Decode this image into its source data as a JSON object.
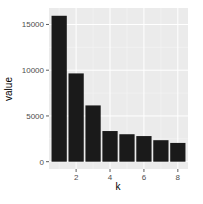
{
  "chart_data": {
    "type": "bar",
    "title": "",
    "xlabel": "k",
    "ylabel": "value",
    "categories": [
      1,
      2,
      3,
      4,
      5,
      6,
      7,
      8
    ],
    "values": [
      15950,
      9650,
      6150,
      3350,
      3000,
      2800,
      2350,
      2050
    ],
    "xlim": [
      0.4,
      8.6
    ],
    "ylim": [
      -800,
      16800
    ],
    "x_ticks": [
      2,
      4,
      6,
      8
    ],
    "y_ticks": [
      0,
      5000,
      10000,
      15000
    ],
    "y_tick_labels": [
      "0",
      "5000",
      "10000",
      "15000"
    ],
    "x_tick_labels": [
      "2",
      "4",
      "6",
      "8"
    ],
    "grid": true,
    "legend": "none",
    "colors": {
      "bar": "#1a1a1a",
      "panel": "#ebebeb",
      "grid": "#ffffff"
    }
  }
}
